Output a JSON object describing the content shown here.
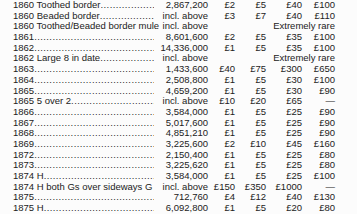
{
  "table": {
    "description": "coin price table",
    "rarity_note_text": "Extremely rare",
    "incl_above_text": "incl. above",
    "rows": [
      {
        "label": "1860 Toothed border",
        "dots": true,
        "mintage": "2,867,200",
        "prices": [
          "£2",
          "£5",
          "£40",
          "£100"
        ]
      },
      {
        "label": "1860 Beaded border",
        "dots": true,
        "mintage": "incl. above",
        "prices": [
          "£3",
          "£7",
          "£40",
          "£110"
        ]
      },
      {
        "label": "1860 Toothed/Beaded border mule",
        "dots": false,
        "mintage": "incl. above",
        "note": "Extremely rare"
      },
      {
        "label": "1861",
        "dots": true,
        "mintage": "8,601,600",
        "prices": [
          "£2",
          "£5",
          "£35",
          "£100"
        ]
      },
      {
        "label": "1862",
        "dots": true,
        "mintage": "14,336,000",
        "prices": [
          "£1",
          "£5",
          "£35",
          "£100"
        ]
      },
      {
        "label": "1862 Large 8 in date",
        "dots": true,
        "mintage": "incl. above",
        "note": "Extremely rare"
      },
      {
        "label": "1863",
        "dots": true,
        "mintage": "1,433,600",
        "prices": [
          "£40",
          "£75",
          "£300",
          "£650"
        ]
      },
      {
        "label": "1864",
        "dots": true,
        "mintage": "2,508,800",
        "prices": [
          "£1",
          "£5",
          "£30",
          "£100"
        ]
      },
      {
        "label": "1865",
        "dots": true,
        "mintage": "4,659,200",
        "prices": [
          "£1",
          "£5",
          "£30",
          "£90"
        ]
      },
      {
        "label": "1865 5 over 2",
        "dots": true,
        "mintage": "incl. above",
        "prices": [
          "£10",
          "£20",
          "£65",
          "—"
        ]
      },
      {
        "label": "1866",
        "dots": true,
        "mintage": "3,584,000",
        "prices": [
          "£1",
          "£5",
          "£25",
          "£90"
        ]
      },
      {
        "label": "1867",
        "dots": true,
        "mintage": "5,017,600",
        "prices": [
          "£1",
          "£5",
          "£25",
          "£90"
        ]
      },
      {
        "label": "1868",
        "dots": true,
        "mintage": "4,851,210",
        "prices": [
          "£1",
          "£5",
          "£25",
          "£90"
        ]
      },
      {
        "label": "1869",
        "dots": true,
        "mintage": "3,225,600",
        "prices": [
          "£2",
          "£10",
          "£45",
          "£160"
        ]
      },
      {
        "label": "1872",
        "dots": true,
        "mintage": "2,150,400",
        "prices": [
          "£1",
          "£5",
          "£25",
          "£80"
        ]
      },
      {
        "label": "1873",
        "dots": true,
        "mintage": "3,225,620",
        "prices": [
          "£1",
          "£5",
          "£25",
          "£80"
        ]
      },
      {
        "label": "1874 H",
        "dots": true,
        "mintage": "3,584,000",
        "prices": [
          "£1",
          "£5",
          "£25",
          "£100"
        ]
      },
      {
        "label": "1874 H both Gs over sideways G",
        "dots": false,
        "mintage": "incl. above",
        "prices": [
          "£150",
          "£350",
          "£1000",
          "—"
        ]
      },
      {
        "label": "1875",
        "dots": true,
        "mintage": "712,760",
        "prices": [
          "£4",
          "£12",
          "£40",
          "£130"
        ]
      },
      {
        "label": "1875 H",
        "dots": true,
        "mintage": "6,092,800",
        "prices": [
          "£1",
          "£5",
          "£20",
          "£80"
        ]
      }
    ]
  }
}
